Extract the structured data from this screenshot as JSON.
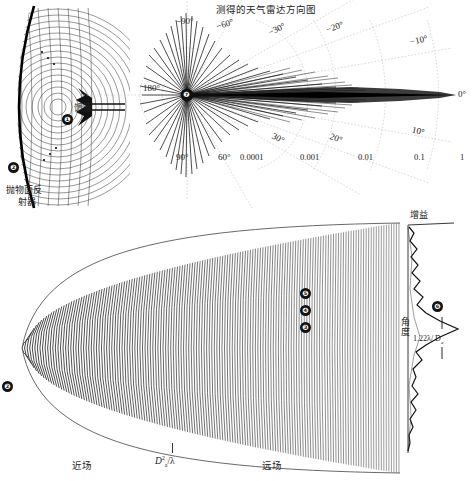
{
  "figure": {
    "kind": "antenna-radiation-pattern-figure",
    "background": "#ffffff",
    "ink": "#111111"
  },
  "panel_reflector": {
    "feed_label": "馈源",
    "reflector_label_line1": "抛物面反",
    "reflector_label_line2": "射器",
    "badge_feed": "❶",
    "badge_reflector": "❷"
  },
  "panel_polar": {
    "title": "测得的天气雷达方向图",
    "center_badge": "❼",
    "angle_labels": [
      "−90°",
      "−60°",
      "−30°",
      "−20°",
      "−10°",
      "0°",
      "10°",
      "20°",
      "30°",
      "60°",
      "90°",
      "180°"
    ],
    "radial_labels": [
      "0.0001",
      "0.001",
      "0.01",
      "0.1",
      "1"
    ],
    "grid_color": "#bdbdbd",
    "trace_color": "#111111"
  },
  "panel_beam": {
    "near_field_label": "近场",
    "far_field_label": "远场",
    "boundary_formula_main": "D",
    "boundary_formula_sub": "a",
    "boundary_formula_sup": "2",
    "boundary_formula_tail": "/λ",
    "badges": [
      "❸",
      "❹",
      "❺"
    ]
  },
  "panel_gain": {
    "gain_label": "增益",
    "angle_label": "角度",
    "beamwidth_label": "1.22λ/ D",
    "beamwidth_sub": "a",
    "badge": "❻"
  },
  "chart_data": {
    "type": "line",
    "title": "测得的天气雷达方向图",
    "subplots": [
      {
        "name": "polar-radiation-pattern",
        "type": "polar-line",
        "xlabel": "",
        "ylabel": "",
        "r_scale": "log",
        "r_ticks": [
          0.0001,
          0.001,
          0.01,
          0.1,
          1
        ],
        "r_tick_labels": [
          "0.0001",
          "0.001",
          "0.01",
          "0.1",
          "1"
        ],
        "theta_ticks_deg": [
          -90,
          -60,
          -30,
          -20,
          -10,
          0,
          10,
          20,
          30,
          60,
          90,
          180
        ],
        "theta_tick_labels": [
          "−90°",
          "−60°",
          "−30°",
          "−20°",
          "−10°",
          "0°",
          "10°",
          "20°",
          "30°",
          "60°",
          "90°",
          "180°"
        ],
        "grid": true,
        "legend": "none",
        "description": "Main lobe at 0 degrees reaching relative power 1; sidelobes fall to 0.001-0.01 within +/-30 degrees; backlobe clutter near 0.0001-0.001 beyond 60 degrees",
        "series": [
          {
            "name": "measured pattern",
            "theta_deg": [
              -180,
              -170,
              -160,
              -150,
              -140,
              -130,
              -120,
              -110,
              -100,
              -90,
              -80,
              -70,
              -60,
              -50,
              -40,
              -35,
              -30,
              -25,
              -20,
              -15,
              -12,
              -10,
              -8,
              -6,
              -4,
              -3,
              -2,
              -1,
              0,
              1,
              2,
              3,
              4,
              6,
              8,
              10,
              12,
              15,
              20,
              25,
              30,
              35,
              40,
              50,
              60,
              70,
              80,
              90,
              100,
              110,
              120,
              130,
              140,
              150,
              160,
              170,
              180
            ],
            "r_values": [
              0.0004,
              0.0005,
              0.0004,
              0.0006,
              0.0005,
              0.0007,
              0.0006,
              0.0008,
              0.0007,
              0.0009,
              0.0008,
              0.001,
              0.0012,
              0.0011,
              0.0014,
              0.0013,
              0.0016,
              0.0018,
              0.0022,
              0.0026,
              0.003,
              0.0035,
              0.0042,
              0.006,
              0.02,
              0.08,
              0.3,
              0.8,
              1.0,
              0.8,
              0.3,
              0.08,
              0.02,
              0.006,
              0.0042,
              0.0035,
              0.003,
              0.0026,
              0.0022,
              0.0018,
              0.0016,
              0.0013,
              0.0014,
              0.0011,
              0.0012,
              0.001,
              0.0008,
              0.0009,
              0.0007,
              0.0008,
              0.0006,
              0.0007,
              0.0005,
              0.0006,
              0.0004,
              0.0005,
              0.0004
            ]
          }
        ]
      },
      {
        "name": "gain-vs-angle",
        "type": "line",
        "xlabel": "增益",
        "ylabel": "角度",
        "annotation": "1.22λ/ Da",
        "grid": false,
        "legend": "none",
        "description": "Gain profile plotted horizontally versus angle on the vertical axis; a dominant main lobe with 1.22 lambda over Da beamwidth and smaller sidelobes above and below",
        "series": [
          {
            "name": "gain",
            "angle": [
              0,
              0.05,
              0.1,
              0.15,
              0.2,
              0.25,
              0.3,
              0.33,
              0.36,
              0.4,
              0.44,
              0.48,
              0.5,
              0.52,
              0.56,
              0.6,
              0.64,
              0.68,
              0.72,
              0.76,
              0.8,
              0.85,
              0.9,
              0.95,
              1.0
            ],
            "gain": [
              0.04,
              0.1,
              0.06,
              0.22,
              0.09,
              0.3,
              0.12,
              0.2,
              0.1,
              0.18,
              0.3,
              0.62,
              1.0,
              0.62,
              0.3,
              0.17,
              0.26,
              0.11,
              0.22,
              0.08,
              0.18,
              0.06,
              0.12,
              0.05,
              0.03
            ]
          }
        ]
      }
    ]
  }
}
